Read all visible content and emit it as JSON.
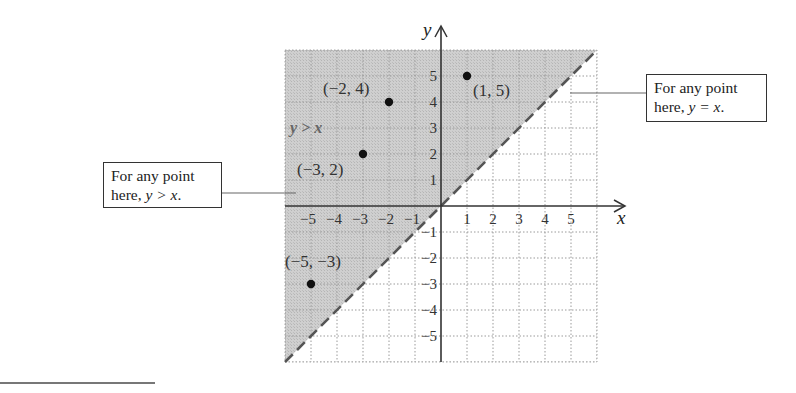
{
  "diagram": {
    "type": "coordinate-plane-inequality",
    "axes": {
      "x_label": "x",
      "y_label": "y",
      "x_ticks": [
        "−5",
        "−4",
        "−3",
        "−2",
        "−1",
        "1",
        "2",
        "3",
        "4",
        "5"
      ],
      "y_ticks": [
        "5",
        "4",
        "3",
        "2",
        "1",
        "−1",
        "−2",
        "−3",
        "−4",
        "−5"
      ],
      "range": [
        -6,
        6
      ]
    },
    "boundary_line": {
      "equation": "y = x",
      "style": "dashed"
    },
    "shaded_region": {
      "label": "y > x",
      "fill": "#c9c9c9"
    },
    "points": [
      {
        "x": -2,
        "y": 4,
        "label": "(−2, 4)"
      },
      {
        "x": 1,
        "y": 5,
        "label": "(1, 5)"
      },
      {
        "x": -3,
        "y": 2,
        "label": "(−3, 2)"
      },
      {
        "x": -5,
        "y": -3,
        "label": "(−5, −3)"
      }
    ],
    "callouts": {
      "right": {
        "line1": "For any point",
        "line2_prefix": "here, ",
        "line2_math": "y = x",
        "line2_suffix": "."
      },
      "left": {
        "line1": "For any point",
        "line2_prefix": "here, ",
        "line2_math": "y > x",
        "line2_suffix": "."
      }
    },
    "colors": {
      "shade": "#c9c9c9",
      "grid": "#9a9a9a",
      "axis": "#333333",
      "dashed_line": "#555555",
      "point": "#111111"
    }
  }
}
